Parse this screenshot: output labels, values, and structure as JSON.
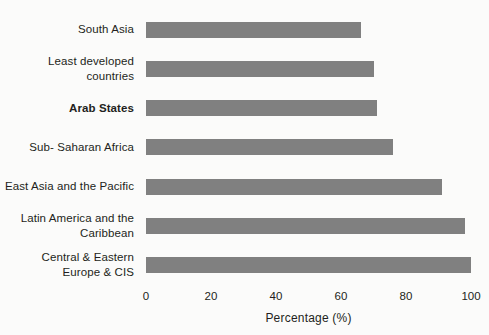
{
  "chart_data": {
    "type": "bar",
    "orientation": "horizontal",
    "title": "",
    "xlabel": "Percentage (%)",
    "ylabel": "",
    "xlim": [
      0,
      100
    ],
    "xticks": [
      "0",
      "20",
      "40",
      "60",
      "80",
      "100"
    ],
    "grid": false,
    "legend": null,
    "bar_color": "#808080",
    "background_color": "#fbfbfa",
    "highlighted_category": "Arab States",
    "categories": [
      "South Asia",
      "Least developed countries",
      "Arab States",
      "Sub- Saharan Africa",
      "East Asia and the Pacific",
      "Latin America and the\nCaribbean",
      "Central & Eastern\nEurope & CIS"
    ],
    "values": [
      66,
      70,
      71,
      76,
      91,
      98,
      100
    ],
    "bars": [
      {
        "label": "South Asia",
        "value": 66,
        "bold": false
      },
      {
        "label": "Least developed countries",
        "value": 70,
        "bold": false
      },
      {
        "label": "Arab States",
        "value": 71,
        "bold": true
      },
      {
        "label": "Sub- Saharan Africa",
        "value": 76,
        "bold": false
      },
      {
        "label": "East Asia and the Pacific",
        "value": 91,
        "bold": false
      },
      {
        "label": "Latin America and the\nCaribbean",
        "value": 98,
        "bold": false
      },
      {
        "label": "Central & Eastern\nEurope & CIS",
        "value": 100,
        "bold": false
      }
    ]
  }
}
